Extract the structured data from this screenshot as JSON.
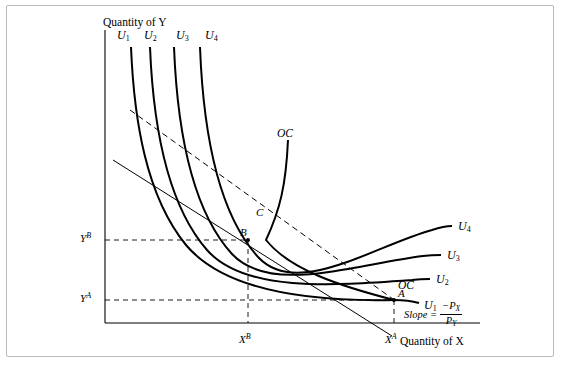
{
  "figure": {
    "axis_titles": {
      "y": "Quantity of  Y",
      "x": "Quantity of  X"
    },
    "indifference_curve_labels_top": [
      "U",
      "U",
      "U",
      "U"
    ],
    "indifference_curve_subs_top": [
      "1",
      "2",
      "3",
      "4"
    ],
    "indifference_curve_labels_right": [
      {
        "base": "U",
        "sub": "4"
      },
      {
        "base": "U",
        "sub": "3"
      },
      {
        "base": "U",
        "sub": "2"
      },
      {
        "base": "U",
        "sub": "1"
      }
    ],
    "offer_curve_label_top": "OC",
    "offer_curve_label_right": "OC",
    "points": [
      {
        "name": "A",
        "label": "A"
      },
      {
        "name": "B",
        "label": "B"
      },
      {
        "name": "C",
        "label": "C"
      }
    ],
    "axis_value_labels": {
      "y_b": {
        "base": "Y",
        "sup": "B"
      },
      "y_a": {
        "base": "Y",
        "sup": "A"
      },
      "x_b": {
        "base": "X",
        "sup": "B"
      },
      "x_a": {
        "base": "X",
        "sup": "A"
      }
    },
    "slope_annotation": {
      "text": "Slope  =",
      "numerator_sign": "−",
      "numerator_base": "P",
      "numerator_sub": "X",
      "denominator_base": "P",
      "denominator_sub": "Y"
    },
    "colors": {
      "ink": "#000000",
      "frame": "#b9b9b9",
      "background": "#ffffff"
    }
  }
}
